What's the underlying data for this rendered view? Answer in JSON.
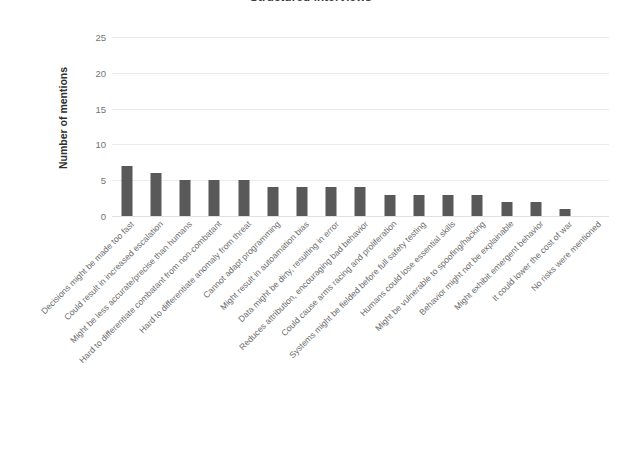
{
  "title": "Structured interviews",
  "colors": {
    "bar": "#595959",
    "gridline": "#ebebeb",
    "tick_text": "#757575",
    "label_text": "#6d6d6d",
    "axis_title": "#2f2f2f",
    "title_text": "#3b3b3b",
    "background": "#ffffff"
  },
  "chart_data": {
    "type": "bar",
    "title": "Structured interviews",
    "xlabel": "",
    "ylabel": "Number of mentions",
    "ylim": [
      0,
      25
    ],
    "yticks": [
      0,
      5,
      10,
      15,
      20,
      25
    ],
    "grid": true,
    "legend": null,
    "orientation": "vertical",
    "categories": [
      "Decisions might be made too fast",
      "Could result in increased escalation",
      "Might be less accurate/precise than humans",
      "Hard to differentiate combatant from non-combatant",
      "Hard to differentiate anomaly from threat",
      "Cannot adapt programming",
      "Might result in autoamation bias",
      "Data might be dirty, resulting in error",
      "Reduces attribution, encouraging bad behavior",
      "Could cause arms racing and proliferation",
      "Systems might be fielded before full safety testing",
      "Humans could lose essential skills",
      "Might be vulnerable to spoofing/hacking",
      "Behavior might not be explainable",
      "Might exhibit emergent behavior",
      "It could lower the cost of war",
      "No risks were mentioned"
    ],
    "values": [
      7,
      6,
      5,
      5,
      5,
      4,
      4,
      4,
      4,
      3,
      3,
      3,
      3,
      2,
      2,
      1,
      0
    ]
  }
}
